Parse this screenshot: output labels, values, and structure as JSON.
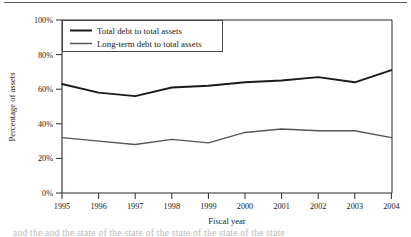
{
  "figure": {
    "name": "debt-to-assets-line-chart",
    "bottom_cut_text": "and the and the state of the state of the state of the state of the state"
  },
  "chart_data": {
    "type": "line",
    "title": "",
    "xlabel": "Fiscal year",
    "ylabel": "Percentage of assets",
    "categories": [
      "1995",
      "1996",
      "1997",
      "1998",
      "1999",
      "2000",
      "2001",
      "2002",
      "2003",
      "2004"
    ],
    "x": [
      1995,
      1996,
      1997,
      1998,
      1999,
      2000,
      2001,
      2002,
      2003,
      2004
    ],
    "series": [
      {
        "name": "Total debt to total assets",
        "color": "#1a1a1a",
        "values": [
          63,
          58,
          56,
          61,
          62,
          64,
          65,
          67,
          64,
          71
        ]
      },
      {
        "name": "Long-term debt to total assets",
        "color": "#565656",
        "values": [
          32,
          30,
          28,
          31,
          29,
          35,
          37,
          36,
          36,
          32
        ]
      }
    ],
    "ylim": [
      0,
      100
    ],
    "yticks": [
      0,
      20,
      40,
      60,
      80,
      100
    ],
    "ytick_labels": [
      "0%",
      "20%",
      "40%",
      "60%",
      "80%",
      "100%"
    ],
    "xtick_labels": [
      "1995",
      "1996",
      "1997",
      "1998",
      "1999",
      "2000",
      "2001",
      "2002",
      "2003",
      "2004"
    ],
    "grid": false,
    "legend_position": "upper left",
    "legend_entries": [
      "Total debt to total assets",
      "Long-term debt to total assets"
    ],
    "axis_color": "#2b2b2b"
  }
}
